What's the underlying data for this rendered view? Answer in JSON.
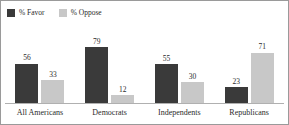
{
  "chart_data": {
    "type": "bar",
    "title": "",
    "subtitle": "",
    "xlabel": "",
    "ylabel": "",
    "ylim": [
      0,
      100
    ],
    "grid": false,
    "legend_position": "top-left",
    "categories": [
      "All Americans",
      "Democrats",
      "Independents",
      "Republicans"
    ],
    "series": [
      {
        "name": "% Favor",
        "color": "#3a3a3a",
        "values": [
          56,
          79,
          55,
          23
        ]
      },
      {
        "name": "% Oppose",
        "color": "#c8c8c8",
        "values": [
          33,
          12,
          30,
          71
        ]
      }
    ]
  },
  "legend": {
    "items": [
      {
        "label": "% Favor",
        "color": "#3a3a3a",
        "swatch_icon": "square-swatch-icon"
      },
      {
        "label": "% Oppose",
        "color": "#c8c8c8",
        "swatch_icon": "square-swatch-icon"
      }
    ]
  },
  "colors": {
    "favor": "#3a3a3a",
    "oppose": "#c8c8c8",
    "baseline": "#b0b0b0",
    "frame": "#9a9a9a",
    "text": "#2b2b2b",
    "background": "#ffffff"
  }
}
